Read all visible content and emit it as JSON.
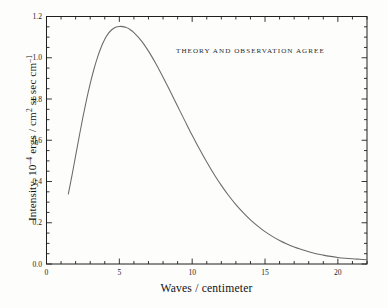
{
  "chart_data": {
    "type": "line",
    "title": "",
    "xlabel": "Waves / centimeter",
    "ylabel_plain": "Intensity, 10^-4 ergs / cm^2 sr sec cm^-1",
    "ylabel_parts": {
      "pre": "Intensity, 10",
      "sup1": "–4",
      "mid": " ergs / cm",
      "sup2": "2",
      "post": " sr sec cm",
      "sup3": "–1"
    },
    "xlim": [
      0,
      22
    ],
    "ylim": [
      0.0,
      1.2
    ],
    "grid": false,
    "legend": "none",
    "x_ticks_major": [
      0,
      5,
      10,
      15,
      20
    ],
    "x_tick_labels": [
      "0",
      "5",
      "10",
      "15",
      "20"
    ],
    "x_tick_minor_step": 1,
    "y_ticks_major": [
      0.0,
      0.2,
      0.4,
      0.6,
      0.8,
      1.0,
      1.2
    ],
    "y_tick_labels": [
      "0.0",
      "0.2",
      "0.4",
      "0.6",
      "0.8",
      "1.0",
      "1.2"
    ],
    "y_tick_minor_step": 0.05,
    "annotations": [
      {
        "text": "THEORY AND OBSERVATION AGREE",
        "x": 10.4,
        "y": 1.05
      }
    ],
    "series": [
      {
        "name": "Blackbody spectrum",
        "color": "#6a6a6a",
        "width": 1.05,
        "peak_x": 5.4,
        "peak_y": 1.15,
        "x": [
          1.5,
          1.75,
          2.0,
          2.25,
          2.5,
          2.75,
          3.0,
          3.25,
          3.5,
          3.75,
          4.0,
          4.25,
          4.5,
          4.75,
          5.0,
          5.25,
          5.5,
          5.75,
          6.0,
          6.25,
          6.5,
          6.75,
          7.0,
          7.25,
          7.5,
          7.75,
          8.0,
          8.5,
          9.0,
          9.5,
          10.0,
          10.5,
          11.0,
          11.5,
          12.0,
          12.5,
          13.0,
          13.5,
          14.0,
          14.5,
          15.0,
          15.5,
          16.0,
          16.5,
          17.0,
          17.5,
          18.0,
          18.5,
          19.0,
          19.5,
          20.0,
          20.5,
          21.0,
          21.5,
          22.0
        ],
        "y": [
          0.34,
          0.43,
          0.525,
          0.62,
          0.712,
          0.797,
          0.874,
          0.943,
          1.002,
          1.051,
          1.09,
          1.118,
          1.137,
          1.148,
          1.152,
          1.151,
          1.146,
          1.136,
          1.122,
          1.104,
          1.083,
          1.059,
          1.032,
          1.003,
          0.972,
          0.94,
          0.906,
          0.836,
          0.765,
          0.694,
          0.624,
          0.557,
          0.494,
          0.435,
          0.381,
          0.332,
          0.288,
          0.249,
          0.214,
          0.184,
          0.157,
          0.134,
          0.114,
          0.097,
          0.082,
          0.07,
          0.059,
          0.05,
          0.043,
          0.037,
          0.032,
          0.028,
          0.025,
          0.023,
          0.021
        ]
      }
    ]
  },
  "figure": {
    "background": "#fdfdfb",
    "frame_color": "#1f1f1f",
    "tick_color": "#1f1f1f"
  }
}
